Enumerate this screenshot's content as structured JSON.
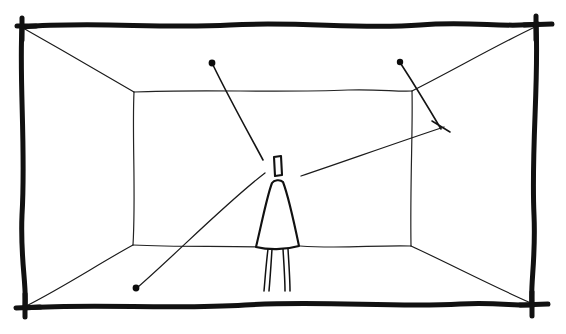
{
  "canvas": {
    "width": 566,
    "height": 334,
    "background_color": "#ffffff",
    "ink_color": "#111111",
    "medium": "hand-drawn pen sketch",
    "title": "One-point perspective room interior with standing figure and sight lines"
  },
  "frame": {
    "name": "hand-drawn rectangular border",
    "stroke_width": 5,
    "corners": {
      "top_left": [
        22,
        26
      ],
      "top_right": [
        536,
        24
      ],
      "bottom_right": [
        532,
        305
      ],
      "bottom_left": [
        25,
        308
      ]
    },
    "edges": [
      {
        "label": "top-edge",
        "path": "M22,27 C90,21 160,29 230,25 C300,21 360,30 420,25 C470,21 505,28 538,24"
      },
      {
        "label": "right-edge",
        "path": "M536,24 C539,80 531,150 534,215 C536,260 530,285 532,306"
      },
      {
        "label": "bottom-edge",
        "path": "M25,308 C95,303 170,310 245,305 C320,300 395,308 460,304 C495,302 515,306 533,305"
      },
      {
        "label": "left-edge",
        "path": "M22,26 C19,80 26,150 22,215 C20,260 27,285 25,308"
      }
    ],
    "corner_ticks": [
      {
        "label": "tick-top-left",
        "path": "M17,26 L36,26"
      },
      {
        "label": "tick-top-right",
        "path": "M524,25 L552,24"
      },
      {
        "label": "tick-bottom-right",
        "path": "M520,305 L548,304"
      },
      {
        "label": "tick-bottom-left",
        "path": "M16,308 L40,307"
      },
      {
        "label": "tick-left-vertical-top",
        "path": "M22,18 L22,40"
      },
      {
        "label": "tick-right-vertical-top",
        "path": "M536,16 L536,40"
      },
      {
        "label": "tick-left-vertical-bottom",
        "path": "M25,294 L25,317"
      },
      {
        "label": "tick-right-vertical-bottom",
        "path": "M532,292 L532,316"
      }
    ]
  },
  "back_wall": {
    "name": "back wall rectangle",
    "corners": {
      "top_left": [
        134,
        92
      ],
      "top_right": [
        412,
        91
      ],
      "bottom_right": [
        411,
        246
      ],
      "bottom_left": [
        133,
        245
      ]
    },
    "edges": [
      {
        "label": "back-wall-top",
        "path": "M134,92 C200,89 280,93 348,90 C378,89 398,92 412,91"
      },
      {
        "label": "back-wall-right",
        "path": "M412,91 C413,130 410,180 411,246"
      },
      {
        "label": "back-wall-bottom-left-segment",
        "path": "M133,245 C175,247 215,246 258,247"
      },
      {
        "label": "back-wall-bottom-right-segment",
        "path": "M300,246 C340,249 375,245 411,246"
      },
      {
        "label": "back-wall-left",
        "path": "M134,92 C132,135 136,195 133,245"
      }
    ]
  },
  "perspective_lines": [
    {
      "label": "corner-line-top-left",
      "from": [
        22,
        27
      ],
      "to": [
        134,
        92
      ],
      "path": "M23,28 C60,49 100,72 134,92"
    },
    {
      "label": "corner-line-top-right",
      "from": [
        536,
        25
      ],
      "to": [
        412,
        91
      ],
      "path": "M535,27 C495,46 450,72 412,91"
    },
    {
      "label": "corner-line-bottom-left",
      "from": [
        25,
        307
      ],
      "to": [
        133,
        245
      ],
      "path": "M26,306 C62,288 100,263 133,245"
    },
    {
      "label": "corner-line-bottom-right",
      "from": [
        532,
        304
      ],
      "to": [
        411,
        246
      ],
      "path": "M531,303 C490,285 448,263 411,246"
    }
  ],
  "sight_rays": [
    {
      "label": "ray-upper-left-to-head",
      "description": "line from dot near ceiling-left down to figure's head area",
      "dot": [
        212,
        63
      ],
      "dot_radius": 3.4,
      "path": "M213,65 C228,96 248,132 263,160"
    },
    {
      "label": "ray-upper-right-crossing",
      "description": "short line from dot near ceiling-right down through back wall corner to tick mark",
      "dot": [
        400,
        62
      ],
      "dot_radius": 3.2,
      "path": "M401,64 C414,84 428,107 441,129"
    },
    {
      "label": "ray-shoulder-to-right-tick",
      "description": "long line from figure's right shoulder up-right to the tick mark",
      "path": "M301,176 C340,163 390,145 444,127"
    },
    {
      "label": "ray-shoulder-to-lower-left-dot",
      "description": "long line from figure's left shoulder down-left to a dot on the floor",
      "dot": [
        136,
        288
      ],
      "dot_radius": 3.4,
      "path": "M265,173 C227,202 176,254 138,287"
    }
  ],
  "tick_marks": [
    {
      "label": "tick-right-ray-end",
      "path": "M432,121 L450,132"
    }
  ],
  "figure": {
    "name": "standing person",
    "head": {
      "label": "head-rectangle",
      "path": "M274,157 L281,156 L282,175 L275,176 Z"
    },
    "body": {
      "label": "torso-trapezoid",
      "path": "M272,183 C274,180 280,179 283,182 C288,195 294,222 299,246 C285,250 268,250 256,247 C262,222 267,196 272,183 Z"
    },
    "legs": [
      {
        "label": "leg-left",
        "path": "M268,249 C266,265 265,280 264,291"
      },
      {
        "label": "leg-left-inner",
        "path": "M272,249 C271,265 270,280 269,291"
      },
      {
        "label": "leg-right",
        "path": "M283,249 C284,265 285,280 285,291"
      },
      {
        "label": "leg-right-inner",
        "path": "M288,249 C289,265 290,280 290,291"
      }
    ]
  }
}
